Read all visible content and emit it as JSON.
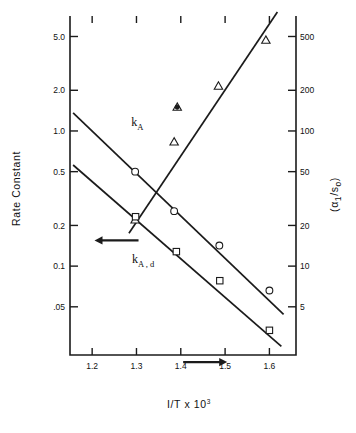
{
  "chart_data": {
    "type": "scatter",
    "title": "",
    "xlabel": "I/T x 10",
    "xlabel_exponent": "3",
    "ylabel_left": "Rate Constant",
    "ylabel_right": "(α₁/s₀)",
    "ylabel_right_parts": {
      "open": "(",
      "alpha": "α",
      "alpha_sub": "1",
      "slash": "/",
      "s": "s",
      "s_sub": "o",
      "close": ")"
    },
    "xscale": "linear",
    "yscale": "log",
    "grid": false,
    "xlim": [
      1.15,
      1.66
    ],
    "xticks": [
      "1.2",
      "1.3",
      "1.4",
      "1.5",
      "1.6"
    ],
    "xtick_values": [
      1.2,
      1.3,
      1.4,
      1.5,
      1.6
    ],
    "yticks_left": [
      "5.0",
      "2.0",
      "1.0",
      "0.5",
      "0.2",
      "0.1",
      ".05"
    ],
    "ytick_values_left": [
      5.0,
      2.0,
      1.0,
      0.5,
      0.2,
      0.1,
      0.05
    ],
    "ylim_left": [
      0.022,
      6.4
    ],
    "yticks_right": [
      "500",
      "200",
      "100",
      "50",
      "20",
      "10",
      "5"
    ],
    "ytick_values_right": [
      500,
      200,
      100,
      50,
      20,
      10,
      5
    ],
    "ylim_right": [
      2.2,
      640
    ],
    "legend_position": "inline-annotations",
    "annotations": [
      {
        "name": "k_A",
        "text": "k",
        "sub": "A",
        "x": 1.288,
        "y": 1.08,
        "axis": "left"
      },
      {
        "name": "k_A,d",
        "text": "k",
        "sub": "A , d",
        "x": 1.29,
        "y": 0.105,
        "axis": "left"
      },
      {
        "name": "arrow-right",
        "glyph": "→",
        "x": 1.455,
        "y": 1.95,
        "axis": "right"
      },
      {
        "name": "arrow-left",
        "glyph": "←",
        "x": 1.255,
        "y": 0.155,
        "axis": "left"
      }
    ],
    "series": [
      {
        "name": "alpha1/s0",
        "marker": "triangle-up",
        "axis": "right",
        "points": [
          {
            "x": 1.297,
            "y": 22
          },
          {
            "x": 1.385,
            "y": 83
          },
          {
            "x": 1.392,
            "y": 150
          },
          {
            "x": 1.485,
            "y": 215
          },
          {
            "x": 1.592,
            "y": 470
          }
        ],
        "fit_line": {
          "x1": 1.283,
          "y1": 17.5,
          "x2": 1.618,
          "y2": 760
        }
      },
      {
        "name": "k_A",
        "marker": "circle-open",
        "axis": "left",
        "points": [
          {
            "x": 1.297,
            "y": 0.5
          },
          {
            "x": 1.385,
            "y": 0.255
          },
          {
            "x": 1.487,
            "y": 0.142
          },
          {
            "x": 1.6,
            "y": 0.066
          }
        ],
        "fit_line": {
          "x1": 1.157,
          "y1": 1.36,
          "x2": 1.632,
          "y2": 0.044
        }
      },
      {
        "name": "k_A,d",
        "marker": "square-open",
        "axis": "left",
        "points": [
          {
            "x": 1.298,
            "y": 0.232
          },
          {
            "x": 1.39,
            "y": 0.128
          },
          {
            "x": 1.488,
            "y": 0.078
          },
          {
            "x": 1.6,
            "y": 0.0335
          }
        ],
        "fit_line": {
          "x1": 1.157,
          "y1": 0.56,
          "x2": 1.627,
          "y2": 0.0255
        }
      },
      {
        "name": "extra-point",
        "marker": "dot-filled",
        "axis": "right",
        "points": [
          {
            "x": 1.392,
            "y": 150
          }
        ]
      }
    ]
  },
  "colors": {
    "ink": "#1b1b1b",
    "background": "#ffffff"
  }
}
